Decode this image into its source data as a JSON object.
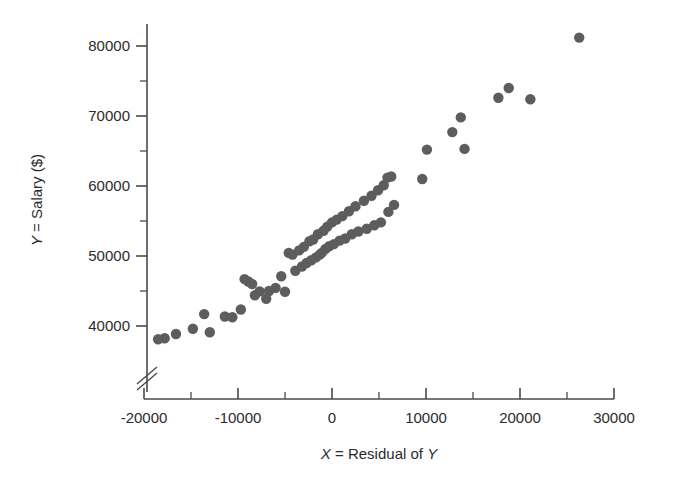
{
  "chart_data": {
    "type": "scatter",
    "title": "",
    "xlabel": "X = Residual of Y",
    "ylabel": "Y = Salary ($)",
    "xlabel_parts": {
      "var": "X",
      "rest": " = Residual of ",
      "var2": "Y"
    },
    "ylabel_parts": {
      "var": "Y",
      "rest": " = Salary ($)"
    },
    "xlim": [
      -20000,
      30000
    ],
    "ylim": [
      36500,
      82500
    ],
    "x_ticks": [
      -20000,
      -10000,
      0,
      10000,
      20000,
      30000
    ],
    "x_tick_labels": [
      "-20000",
      "-10000",
      "0",
      "10000",
      "20000",
      "30000"
    ],
    "x_minor_ticks": [
      -15000,
      -5000,
      5000,
      15000,
      25000
    ],
    "y_ticks": [
      40000,
      50000,
      60000,
      70000,
      80000
    ],
    "y_tick_labels": [
      "40000",
      "50000",
      "60000",
      "70000",
      "80000"
    ],
    "y_minor_ticks": [
      45000,
      55000,
      65000,
      75000
    ],
    "y_axis_break": true,
    "y_axis_break_value": 37300,
    "grid": false,
    "legend": null,
    "marker": {
      "shape": "circle",
      "size": 8,
      "color": "#5d5d5d"
    },
    "points": [
      {
        "x": -18500,
        "y": 38100
      },
      {
        "x": -17800,
        "y": 38250
      },
      {
        "x": -16600,
        "y": 38850
      },
      {
        "x": -14800,
        "y": 39600
      },
      {
        "x": -13600,
        "y": 41700
      },
      {
        "x": -13000,
        "y": 39100
      },
      {
        "x": -11400,
        "y": 41350
      },
      {
        "x": -10600,
        "y": 41250
      },
      {
        "x": -9700,
        "y": 42350
      },
      {
        "x": -9300,
        "y": 46700
      },
      {
        "x": -8900,
        "y": 46350
      },
      {
        "x": -8500,
        "y": 46000
      },
      {
        "x": -8200,
        "y": 44400
      },
      {
        "x": -7700,
        "y": 44950
      },
      {
        "x": -7000,
        "y": 43900
      },
      {
        "x": -6700,
        "y": 45000
      },
      {
        "x": -6000,
        "y": 45450
      },
      {
        "x": -5400,
        "y": 47100
      },
      {
        "x": -5000,
        "y": 44900
      },
      {
        "x": -4600,
        "y": 50450
      },
      {
        "x": -4200,
        "y": 50200
      },
      {
        "x": -3900,
        "y": 47900
      },
      {
        "x": -3500,
        "y": 50800
      },
      {
        "x": -3200,
        "y": 48500
      },
      {
        "x": -3000,
        "y": 51300
      },
      {
        "x": -2700,
        "y": 49000
      },
      {
        "x": -2400,
        "y": 52100
      },
      {
        "x": -2200,
        "y": 49400
      },
      {
        "x": -2000,
        "y": 52350
      },
      {
        "x": -1700,
        "y": 49800
      },
      {
        "x": -1500,
        "y": 53100
      },
      {
        "x": -1300,
        "y": 50200
      },
      {
        "x": -1100,
        "y": 50450
      },
      {
        "x": -900,
        "y": 53600
      },
      {
        "x": -700,
        "y": 51000
      },
      {
        "x": -500,
        "y": 54200
      },
      {
        "x": -300,
        "y": 51400
      },
      {
        "x": 0,
        "y": 54800
      },
      {
        "x": 200,
        "y": 51700
      },
      {
        "x": 500,
        "y": 55200
      },
      {
        "x": 800,
        "y": 52200
      },
      {
        "x": 1100,
        "y": 55700
      },
      {
        "x": 1400,
        "y": 52500
      },
      {
        "x": 1800,
        "y": 56400
      },
      {
        "x": 2100,
        "y": 53100
      },
      {
        "x": 2500,
        "y": 57100
      },
      {
        "x": 2800,
        "y": 53500
      },
      {
        "x": 3400,
        "y": 57900
      },
      {
        "x": 3700,
        "y": 53900
      },
      {
        "x": 4200,
        "y": 58600
      },
      {
        "x": 4500,
        "y": 54400
      },
      {
        "x": 4900,
        "y": 59400
      },
      {
        "x": 5200,
        "y": 54800
      },
      {
        "x": 5500,
        "y": 60100
      },
      {
        "x": 5900,
        "y": 61200
      },
      {
        "x": 6300,
        "y": 61350
      },
      {
        "x": 6000,
        "y": 56300
      },
      {
        "x": 6600,
        "y": 57300
      },
      {
        "x": 9600,
        "y": 61000
      },
      {
        "x": 10100,
        "y": 65200
      },
      {
        "x": 12800,
        "y": 67700
      },
      {
        "x": 13700,
        "y": 69800
      },
      {
        "x": 14100,
        "y": 65300
      },
      {
        "x": 17700,
        "y": 72600
      },
      {
        "x": 18800,
        "y": 74000
      },
      {
        "x": 21100,
        "y": 72400
      },
      {
        "x": 26300,
        "y": 81200
      }
    ]
  }
}
